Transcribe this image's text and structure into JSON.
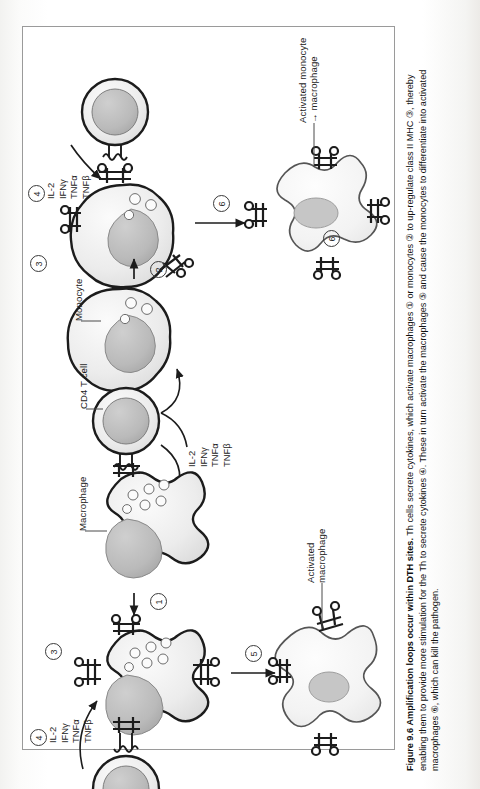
{
  "figure": {
    "number": "Figure 9.6",
    "title": "Amplification loops occur within DTH sites.",
    "caption_body": " Th cells secrete cytokines, which activate macrophages ① or monocytes ② to up-regulate class II MHC ③, thereby enabling them to provide more stimulation for the Th to secrete cytokines ④. These in turn activate the macrophages ⑤ and cause the monocytes to differentiate into activated macrophages ⑥, which can kill the pathogen."
  },
  "cell_labels": {
    "macrophage": "Macrophage",
    "cd4_t_cell": "CD4 T cell",
    "monocyte": "Monocyte",
    "activated_macrophage_line1": "Activated",
    "activated_macrophage_line2": "macrophage",
    "activated_monocyte_line1": "Activated monocyte",
    "activated_monocyte_line2": "→ macrophage"
  },
  "cytokines": {
    "items": [
      "IL-2",
      "IFNγ",
      "TNFα",
      "TNFβ"
    ]
  },
  "step_numbers": {
    "one": "1",
    "two": "2",
    "three": "3",
    "four": "4",
    "five": "5",
    "six": "6"
  },
  "colors": {
    "outline": "#1c1c1c",
    "cytoplasm": "#ededed",
    "nucleus": "#b9b9b9",
    "activated_cell": "#f4f4f4",
    "border": "#9a9a9a",
    "leader": "#4a4a4a"
  }
}
